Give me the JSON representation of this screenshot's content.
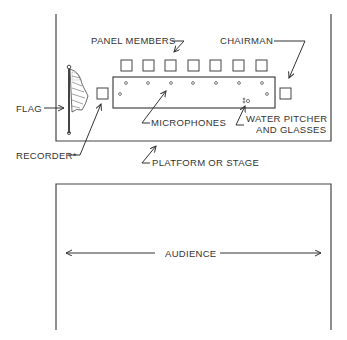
{
  "diagram": {
    "type": "room-layout",
    "labels": {
      "panel_members": "PANEL MEMBERS",
      "chairman": "CHAIRMAN",
      "flag": "FLAG",
      "recorder": "RECORDER*",
      "microphones": "MICROPHONES",
      "water_line1": "WATER PITCHER",
      "water_line2": "AND GLASSES",
      "platform": "PLATFORM OR STAGE",
      "audience": "AUDIENCE"
    },
    "panel_member_count": 7,
    "colors": {
      "line": "#333333",
      "background": "#ffffff"
    }
  }
}
